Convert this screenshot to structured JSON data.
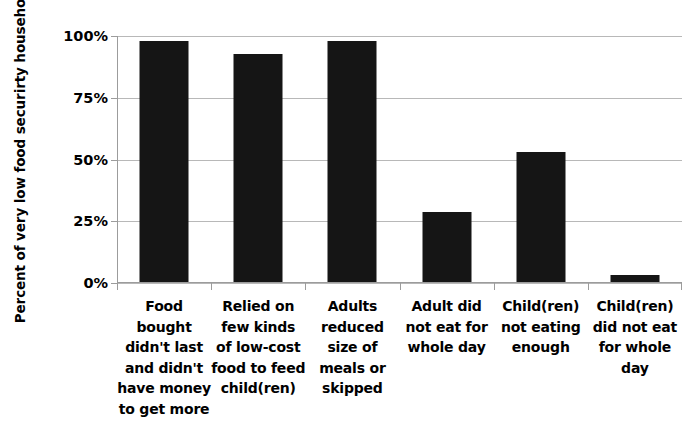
{
  "chart_data": {
    "type": "bar",
    "title": "",
    "subtitle": "",
    "xlabel": "",
    "ylabel": "Percent of very low food securirty households",
    "categories": [
      "Food bought didn't last and didn't have money to get more",
      "Relied on few kinds of low-cost food to feed child(ren)",
      "Adults reduced size of meals or skipped",
      "Adult did not eat for whole day",
      "Child(ren) not eating enough",
      "Child(ren) did not eat for whole day"
    ],
    "category_lines": [
      [
        "Food",
        "bought",
        "didn't last",
        "and didn't",
        "have money",
        "to get more"
      ],
      [
        "Relied on",
        "few kinds",
        "of low-cost",
        "food to feed",
        "child(ren)"
      ],
      [
        "Adults",
        "reduced",
        "size of",
        "meals or",
        "skipped"
      ],
      [
        "Adult did",
        "not eat for",
        "whole day"
      ],
      [
        "Child(ren)",
        "not eating",
        "enough"
      ],
      [
        "Child(ren)",
        "did not eat",
        "for whole",
        "day"
      ]
    ],
    "values": [
      97.5,
      92.5,
      97.5,
      28.5,
      52.5,
      3
    ],
    "ylim": [
      0,
      100
    ],
    "ytick_labels": [
      "0%",
      "25%",
      "50%",
      "75%",
      "100%"
    ],
    "ytick_values": [
      0,
      25,
      50,
      75,
      100
    ],
    "grid": true,
    "legend": "none",
    "bar_color": "#151515",
    "gridline_color": "#b8b8b8",
    "axis_color": "#9c9c9c",
    "background_color": "#ffffff"
  }
}
